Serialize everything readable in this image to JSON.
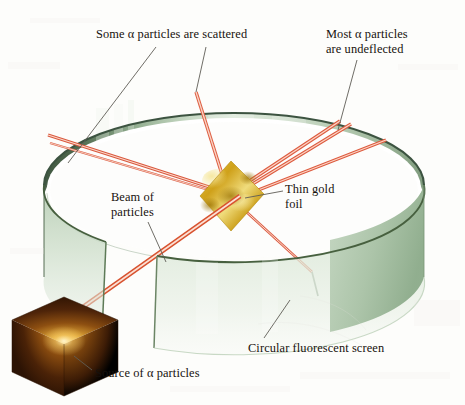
{
  "figure": {
    "background_color": "#fdfdfb"
  },
  "labels": {
    "scattered": "Some α particles are scattered",
    "undeflected_line1": "Most α particles",
    "undeflected_line2": "are undeflected",
    "gold_foil_line1": "Thin gold",
    "gold_foil_line2": "foil",
    "beam_line1": "Beam of",
    "beam_line2": "particles",
    "screen": "Circular fluorescent screen",
    "source": "Source of α particles"
  },
  "colors": {
    "screen_light": "#dfe9dc",
    "screen_mid": "#a8c0a4",
    "screen_dark": "#4c6550",
    "screen_rim": "#3c5340",
    "screen_shadow": "#6f8a71",
    "ray": "#e8604a",
    "ray_core": "#f8b9a8",
    "foil_gold": "#d9ab20",
    "foil_gold_light": "#f2dc72",
    "foil_gold_dark": "#a8800f",
    "source_dark": "#3b1c0b",
    "source_mid": "#8a4a12",
    "source_bright": "#f3d06a",
    "leader": "#585550",
    "text": "#17110d"
  },
  "geometry": {
    "foil_center": {
      "x": 231,
      "y": 196
    },
    "source_center": {
      "x": 64,
      "y": 332
    },
    "screen_center": {
      "x": 234,
      "y": 185
    },
    "screen_rx": 190,
    "screen_ry": 72,
    "screen_band_height": 92
  },
  "rays": {
    "incident_beam": {
      "from": "source",
      "to": "foil",
      "label": "Beam of particles"
    },
    "undeflected_count": 3,
    "scattered_count": 5,
    "undeflected": [
      {
        "angle_deg": -32,
        "length": 185
      },
      {
        "angle_deg": -26,
        "length": 188
      },
      {
        "angle_deg": -17,
        "length": 176
      }
    ],
    "scattered": [
      {
        "angle_deg": -113,
        "length": 120
      },
      {
        "angle_deg": 176,
        "length": 98
      },
      {
        "angle_deg": 168,
        "length": 96
      },
      {
        "angle_deg": 35,
        "length": 120
      },
      {
        "angle_deg": 60,
        "length": 100
      }
    ]
  }
}
